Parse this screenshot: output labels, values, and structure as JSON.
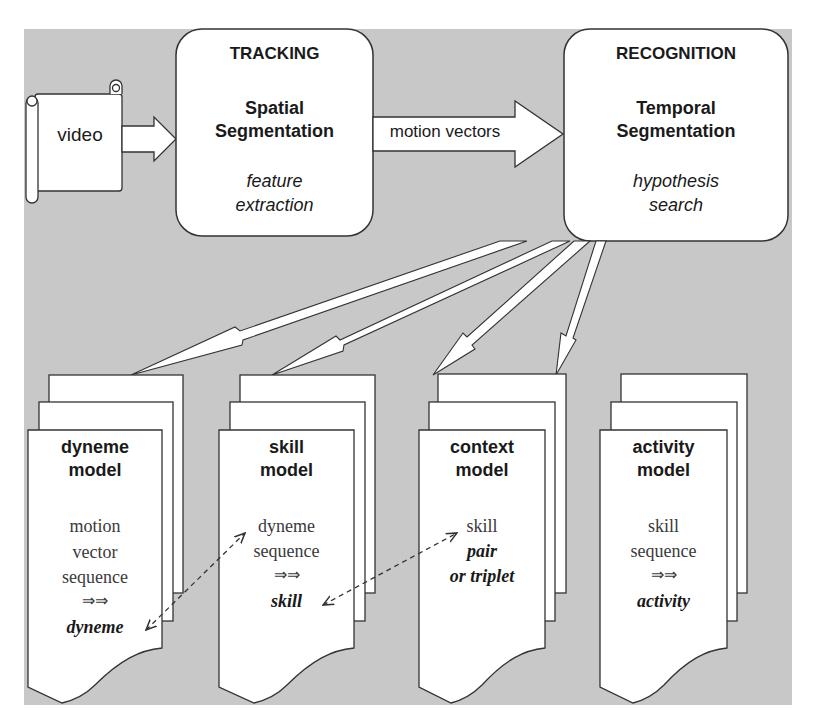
{
  "diagram": {
    "background_color": "#c8c8c8",
    "box_fill": "#ffffff",
    "stroke_color": "#333333",
    "input": {
      "label": "video",
      "shape": "scroll"
    },
    "tracking": {
      "title": "TRACKING",
      "subtitle_line1": "Spatial",
      "subtitle_line2": "Segmentation",
      "detail_line1": "feature",
      "detail_line2": "extraction"
    },
    "motion_arrow": {
      "label": "motion vectors"
    },
    "recognition": {
      "title": "RECOGNITION",
      "subtitle_line1": "Temporal",
      "subtitle_line2": "Segmentation",
      "detail_line1": "hypothesis",
      "detail_line2": "search"
    },
    "models": [
      {
        "title_line1": "dyneme",
        "title_line2": "model",
        "body": [
          "motion",
          "vector",
          "sequence"
        ],
        "arrow_glyph": "⇒⇒",
        "output": "dyneme"
      },
      {
        "title_line1": "skill",
        "title_line2": "model",
        "body": [
          "dyneme",
          "sequence"
        ],
        "arrow_glyph": "⇒⇒",
        "output": "skill"
      },
      {
        "title_line1": "context",
        "title_line2": "model",
        "body": [
          "skill"
        ],
        "body_italic": [
          "pair",
          "or triplet"
        ]
      },
      {
        "title_line1": "activity",
        "title_line2": "model",
        "body": [
          "skill",
          "sequence"
        ],
        "arrow_glyph": "⇒⇒",
        "output": "activity"
      }
    ],
    "edges": [
      {
        "from": "video",
        "to": "tracking",
        "style": "block-arrow"
      },
      {
        "from": "tracking",
        "to": "recognition",
        "style": "block-arrow",
        "label": "motion vectors"
      },
      {
        "from": "recognition",
        "to": "dyneme model",
        "style": "thin-block-arrow"
      },
      {
        "from": "recognition",
        "to": "skill model",
        "style": "thin-block-arrow"
      },
      {
        "from": "recognition",
        "to": "context model",
        "style": "thin-block-arrow"
      },
      {
        "from": "recognition",
        "to": "activity model",
        "style": "thin-block-arrow"
      },
      {
        "from": "dyneme model",
        "to": "skill model",
        "style": "dashed-bidirectional"
      },
      {
        "from": "skill model",
        "to": "context model",
        "style": "dashed-bidirectional"
      }
    ]
  }
}
